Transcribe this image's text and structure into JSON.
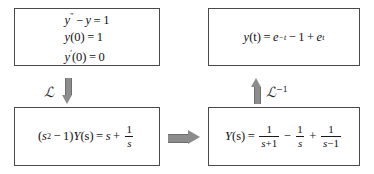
{
  "diagram": {
    "boxes": {
      "ode": {
        "lines": [
          {
            "lhs": "y",
            "prime": "″",
            "op": "−",
            "var": "y",
            "eq": "=",
            "rhs": "1"
          },
          {
            "text_parts": {
              "f": "y",
              "arg": "(0)",
              "eq": "=",
              "rhs": "1"
            }
          },
          {
            "text_parts": {
              "f": "y",
              "prime": "′",
              "arg": "(0)",
              "eq": "=",
              "rhs": "0"
            }
          }
        ],
        "plain": [
          "y″ − y = 1",
          "y(0) = 1",
          "y′(0) = 0"
        ]
      },
      "solution": {
        "plain": "y(t) = e⁻t − 1 + eᵗ",
        "parts": {
          "lhs_fn": "y",
          "lhs_arg": "(t)",
          "eq": "=",
          "e1": "e",
          "e1_sup": "−t",
          "minus": "−",
          "one": "1",
          "plus": "+",
          "e2": "e",
          "e2_sup": "t"
        }
      },
      "algebraic": {
        "plain": "(s² − 1)Y(s) = s + 1/s",
        "parts": {
          "open": "(",
          "s": "s",
          "s_sup": "2",
          "minus": "−",
          "one": "1",
          "close": ")",
          "Y": "Y",
          "Y_arg": "(s)",
          "eq": "=",
          "rhs_s": "s",
          "plus": "+",
          "frac_num": "1",
          "frac_den": "s"
        }
      },
      "partial_fractions": {
        "plain": "Y(s) = 1/(s+1) − 1/s + 1/(s−1)",
        "parts": {
          "Y": "Y",
          "Y_arg": "(s)",
          "eq": "=",
          "t1_num": "1",
          "t1_den_s": "s",
          "t1_den_op": "+",
          "t1_den_n": "1",
          "op1": "−",
          "t2_num": "1",
          "t2_den": "s",
          "op2": "+",
          "t3_num": "1",
          "t3_den_s": "s",
          "t3_den_op": "−",
          "t3_den_n": "1"
        }
      }
    },
    "operators": {
      "forward": {
        "symbol": "ℒ",
        "superscript": "",
        "label": "ℒ",
        "name": "laplace-transform"
      },
      "inverse": {
        "symbol": "ℒ",
        "superscript": "−1",
        "label": "ℒ⁻¹",
        "name": "inverse-laplace-transform"
      }
    },
    "arrows": {
      "down": "arrow-down",
      "up": "arrow-up",
      "right": "arrow-right"
    },
    "colors": {
      "border": "#4a4a4a",
      "arrow_fill": "#8c8c8c",
      "text": "#111111",
      "background": "#ffffff"
    }
  }
}
